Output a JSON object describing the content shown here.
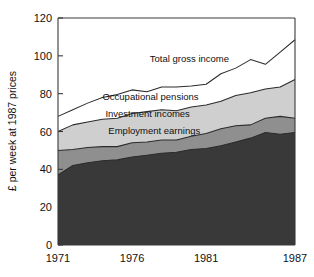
{
  "chart_data": {
    "type": "area",
    "stacked": true,
    "title": "",
    "xlabel": "",
    "ylabel": "£ per week at 1987 prices",
    "xlim": [
      1971,
      1987
    ],
    "ylim": [
      0,
      120
    ],
    "grid": false,
    "legend_position": "inline-labels",
    "x": [
      1971,
      1972,
      1973,
      1974,
      1975,
      1976,
      1977,
      1978,
      1979,
      1980,
      1981,
      1982,
      1983,
      1984,
      1985,
      1986,
      1987
    ],
    "xticks": [
      1971,
      1976,
      1981,
      1987
    ],
    "xticklabels": [
      "1971",
      "1976",
      "1981",
      "1987"
    ],
    "yticks": [
      0,
      20,
      40,
      60,
      80,
      100,
      120
    ],
    "yticklabels": [
      "0",
      "20",
      "40",
      "60",
      "80",
      "100",
      "120"
    ],
    "series": [
      {
        "name": "Employment earnings",
        "color": "#393939",
        "label_x": 1974.4,
        "label_y": 58.5,
        "values": [
          37.0,
          42.0,
          43.5,
          44.5,
          45.0,
          46.5,
          47.5,
          48.5,
          49.0,
          50.5,
          51.0,
          52.5,
          54.5,
          56.5,
          59.5,
          58.5,
          59.5
        ]
      },
      {
        "name": "Investment incomes",
        "color": "#8f8f8f",
        "label_x": 1974.2,
        "label_y": 67.5,
        "values": [
          13.0,
          8.5,
          8.0,
          7.5,
          7.0,
          7.5,
          7.0,
          7.0,
          6.5,
          7.0,
          8.0,
          9.0,
          8.5,
          7.0,
          7.5,
          9.5,
          7.5
        ]
      },
      {
        "name": "Occupational pensions",
        "color": "#cfcfcf",
        "label_x": 1974.0,
        "label_y": 76.5,
        "values": [
          10.0,
          13.0,
          13.5,
          14.5,
          15.0,
          15.5,
          16.0,
          16.0,
          15.5,
          15.5,
          15.0,
          14.5,
          16.0,
          17.0,
          15.5,
          15.5,
          20.5
        ]
      },
      {
        "name": "Total gross income",
        "color": "#ffffff",
        "label_x": 1977.2,
        "label_y": 97.0,
        "values": [
          8.0,
          8.0,
          10.0,
          11.5,
          12.5,
          12.5,
          10.5,
          12.0,
          12.5,
          11.0,
          11.0,
          14.5,
          14.5,
          17.5,
          13.0,
          18.5,
          21.0
        ]
      }
    ],
    "cumulative_tops": {
      "Employment earnings": [
        37.0,
        42.0,
        43.5,
        44.5,
        45.0,
        46.5,
        47.5,
        48.5,
        49.0,
        50.5,
        51.0,
        52.5,
        54.5,
        56.5,
        59.5,
        58.5,
        59.5
      ],
      "Investment incomes": [
        50.0,
        50.5,
        51.5,
        52.0,
        52.0,
        54.0,
        54.5,
        55.5,
        55.5,
        57.5,
        59.0,
        61.5,
        63.0,
        63.5,
        67.0,
        68.0,
        67.0
      ],
      "Occupational pensions": [
        60.0,
        63.5,
        65.0,
        66.5,
        67.0,
        69.5,
        70.5,
        71.5,
        71.0,
        73.0,
        74.0,
        76.0,
        79.0,
        80.5,
        82.5,
        83.5,
        87.5
      ],
      "Total gross income": [
        68.0,
        71.5,
        75.0,
        78.0,
        79.5,
        82.0,
        81.0,
        83.5,
        83.5,
        84.0,
        85.0,
        90.5,
        93.5,
        98.0,
        95.5,
        102.0,
        108.5
      ]
    }
  },
  "axes": {
    "y_axis_title": "£ per week at 1987 prices"
  }
}
